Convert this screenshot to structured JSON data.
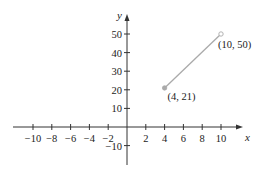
{
  "chart_data": {
    "type": "line",
    "title": "",
    "xlabel": "x",
    "ylabel": "y",
    "xlim": [
      -12,
      12
    ],
    "ylim": [
      -20,
      60
    ],
    "grid": false,
    "x_ticks": [
      -10,
      -8,
      -6,
      -4,
      -2,
      2,
      4,
      6,
      8,
      10
    ],
    "x_tick_labels": [
      "−10",
      "−8",
      "−6",
      "−4",
      "−2",
      "2",
      "4",
      "6",
      "8",
      "10"
    ],
    "y_ticks": [
      50,
      40,
      30,
      20,
      10,
      -10
    ],
    "y_tick_labels": [
      "50",
      "40",
      "30",
      "20",
      "10",
      "−10"
    ],
    "series": [
      {
        "name": "segment",
        "x": [
          4,
          10
        ],
        "y": [
          21,
          50
        ],
        "color": "#aaaaaa",
        "endpoints": [
          {
            "x": 4,
            "y": 21,
            "style": "closed",
            "label": "(4, 21)"
          },
          {
            "x": 10,
            "y": 50,
            "style": "open",
            "label": "(10, 50)"
          }
        ]
      }
    ],
    "annotations": [
      "(4, 21)",
      "(10, 50)"
    ]
  },
  "colors": {
    "axis": "#333333",
    "segment": "#aaaaaa",
    "text": "#222222"
  }
}
